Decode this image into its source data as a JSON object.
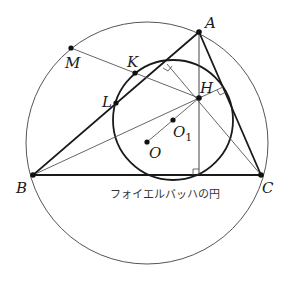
{
  "diagram": {
    "title": "フォイエルバッハの円",
    "points": {
      "A": {
        "label": "A",
        "x": 199,
        "y": 32
      },
      "B": {
        "label": "B",
        "x": 33,
        "y": 175
      },
      "C": {
        "label": "C",
        "x": 261,
        "y": 175
      },
      "H": {
        "label": "H",
        "x": 199,
        "y": 98
      },
      "O": {
        "label": "O",
        "x": 147,
        "y": 142
      },
      "O1": {
        "label": "O",
        "sub": "1",
        "x": 173,
        "y": 120
      },
      "K": {
        "label": "K",
        "x": 135,
        "y": 73
      },
      "L": {
        "label": "L",
        "x": 116,
        "y": 103
      },
      "M": {
        "label": "M",
        "x": 71,
        "y": 48
      }
    },
    "caption": "フォイエルバッハの円",
    "colors": {
      "stroke": "#1a1a1a",
      "thin": "#555555"
    }
  }
}
